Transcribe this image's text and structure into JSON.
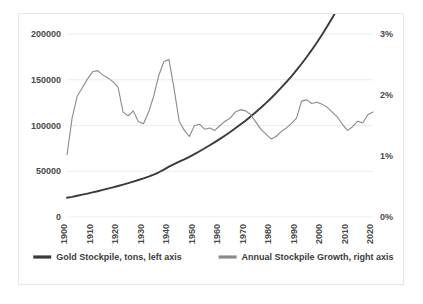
{
  "card": {
    "background": "#ffffff",
    "border_color": "#e8e8e8"
  },
  "legend": {
    "position": "bottom",
    "items": [
      {
        "label": "Gold Stockpile, tons, left axis",
        "color": "#3a3a3a"
      },
      {
        "label": "Annual Stockpile Growth, right axis",
        "color": "#8a8a8a"
      }
    ]
  },
  "axes": {
    "left": {
      "ticks": [
        "0",
        "50000",
        "100000",
        "150000",
        "200000"
      ],
      "values": [
        0,
        50000,
        100000,
        150000,
        200000
      ]
    },
    "right": {
      "ticks": [
        "0%",
        "1%",
        "2%",
        "3%"
      ],
      "values": [
        0,
        1,
        2,
        3
      ]
    },
    "bottom": {
      "ticks": [
        "1900",
        "1910",
        "1920",
        "1930",
        "1940",
        "1950",
        "1960",
        "1970",
        "1980",
        "1990",
        "2000",
        "2010",
        "2020"
      ],
      "values": [
        1900,
        1910,
        1920,
        1930,
        1940,
        1950,
        1960,
        1970,
        1980,
        1990,
        2000,
        2010,
        2020
      ]
    }
  },
  "chart_data": {
    "type": "line",
    "title": "",
    "subtitle": "",
    "xlabel": "",
    "ylabel": "",
    "y2label": "",
    "grid": true,
    "legend_position": "bottom",
    "xlim": [
      1900,
      2020
    ],
    "ylim": [
      0,
      200000
    ],
    "y2lim": [
      0,
      3
    ],
    "x": [
      1900,
      1902,
      1904,
      1906,
      1908,
      1910,
      1912,
      1914,
      1916,
      1918,
      1920,
      1922,
      1924,
      1926,
      1928,
      1930,
      1932,
      1934,
      1936,
      1938,
      1940,
      1942,
      1944,
      1946,
      1948,
      1950,
      1952,
      1954,
      1956,
      1958,
      1960,
      1962,
      1964,
      1966,
      1968,
      1970,
      1972,
      1974,
      1976,
      1978,
      1980,
      1982,
      1984,
      1986,
      1988,
      1990,
      1992,
      1994,
      1996,
      1998,
      2000,
      2002,
      2004,
      2006,
      2008,
      2010,
      2012,
      2014,
      2016,
      2018,
      2020
    ],
    "series": [
      {
        "name": "Gold Stockpile, tons, left axis",
        "axis": "left",
        "color": "#3a3a3a",
        "unit": "tons",
        "values": [
          21000,
          22000,
          23200,
          24400,
          25600,
          26900,
          28200,
          29600,
          31000,
          32400,
          33900,
          35400,
          37000,
          38700,
          40400,
          42200,
          44200,
          46400,
          48900,
          51800,
          55000,
          57800,
          60400,
          63000,
          65800,
          68800,
          71900,
          75100,
          78400,
          81800,
          85400,
          89100,
          92900,
          96900,
          101000,
          105300,
          109800,
          114500,
          119400,
          124500,
          129800,
          135400,
          141300,
          147400,
          153800,
          160500,
          167500,
          174900,
          182600,
          190700,
          199200,
          208100,
          217500,
          227300,
          237600,
          248400,
          259700,
          271600,
          284100,
          297200,
          311000
        ]
      },
      {
        "name": "Annual Stockpile Growth, right axis",
        "axis": "right",
        "color": "#8a8a8a",
        "unit": "%",
        "values": [
          1.02,
          1.62,
          1.98,
          2.12,
          2.26,
          2.38,
          2.4,
          2.33,
          2.28,
          2.22,
          2.13,
          1.72,
          1.66,
          1.74,
          1.56,
          1.53,
          1.72,
          1.98,
          2.32,
          2.55,
          2.58,
          2.1,
          1.57,
          1.42,
          1.32,
          1.5,
          1.52,
          1.44,
          1.46,
          1.42,
          1.5,
          1.57,
          1.62,
          1.72,
          1.76,
          1.74,
          1.68,
          1.56,
          1.44,
          1.36,
          1.28,
          1.32,
          1.4,
          1.46,
          1.53,
          1.62,
          1.9,
          1.92,
          1.86,
          1.88,
          1.85,
          1.8,
          1.72,
          1.64,
          1.52,
          1.42,
          1.48,
          1.57,
          1.54,
          1.68,
          1.72
        ]
      }
    ]
  }
}
